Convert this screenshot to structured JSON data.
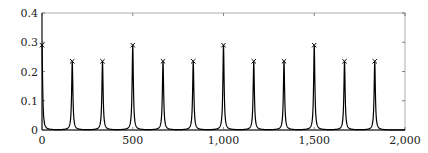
{
  "chart_data": {
    "type": "line",
    "title": "",
    "xlabel": "",
    "ylabel": "",
    "xlim": [
      0,
      2000
    ],
    "ylim": [
      0,
      0.4
    ],
    "grid": false,
    "legend": null,
    "x_ticks": [
      0,
      500,
      1000,
      1500,
      2000
    ],
    "x_tick_labels": [
      "0",
      "500",
      "1,000",
      "1,500",
      "2,000"
    ],
    "y_ticks": [
      0,
      0.1,
      0.2,
      0.3,
      0.4
    ],
    "y_tick_labels": [
      "0",
      "0.1",
      "0.2",
      "0.3",
      "0.4"
    ],
    "series": [
      {
        "name": "spectrum",
        "style": "line",
        "color": "#000000",
        "peak_width": 4
      },
      {
        "name": "peak markers",
        "style": "marker-x",
        "color": "#000000",
        "x": [
          0,
          166.7,
          333.3,
          500,
          666.7,
          833.3,
          1000,
          1166.7,
          1333.3,
          1500,
          1666.7,
          1833.3
        ],
        "y": [
          0.29,
          0.235,
          0.235,
          0.29,
          0.235,
          0.235,
          0.29,
          0.235,
          0.235,
          0.29,
          0.235,
          0.235
        ]
      }
    ]
  }
}
